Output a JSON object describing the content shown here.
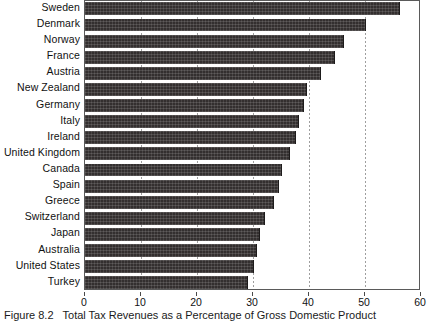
{
  "figure": {
    "number_label": "Figure 8.2",
    "caption": "Total Tax Revenues as a Percentage of Gross Domestic Product"
  },
  "chart_data": {
    "type": "bar",
    "orientation": "horizontal",
    "title": "Total Tax Revenues as a Percentage of Gross Domestic Product",
    "xlabel": "",
    "ylabel": "",
    "xlim": [
      0,
      60
    ],
    "ylim": null,
    "grid": "vertical dotted gridlines at 10, 20, 30, 40, 50 (visible only where not covered by bars)",
    "legend": "none",
    "bar_color": "#332f2f",
    "xticks": [
      "0",
      "10",
      "20",
      "30",
      "40",
      "50",
      "60"
    ],
    "xtick_values": [
      0,
      10,
      20,
      30,
      40,
      50,
      60
    ],
    "categories": [
      "Sweden",
      "Denmark",
      "Norway",
      "France",
      "Austria",
      "New Zealand",
      "Germany",
      "Italy",
      "Ireland",
      "United Kingdom",
      "Canada",
      "Spain",
      "Greece",
      "Switzerland",
      "Japan",
      "Australia",
      "United States",
      "Turkey"
    ],
    "values": [
      56,
      50,
      46,
      44.5,
      42,
      39.5,
      39,
      38,
      37.5,
      36.5,
      35,
      34.5,
      33.5,
      32,
      31,
      30.5,
      30,
      29
    ]
  }
}
